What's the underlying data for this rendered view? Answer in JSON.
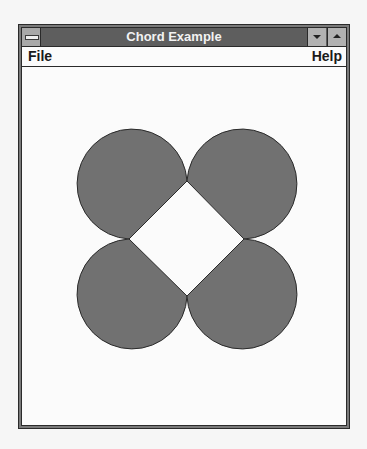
{
  "window": {
    "title": "Chord Example",
    "system_menu_icon": "system-menu-icon",
    "minimize_icon": "minimize-arrow-icon",
    "maximize_icon": "maximize-arrow-icon"
  },
  "menubar": {
    "items": [
      {
        "label": "File"
      },
      {
        "label": "Help"
      }
    ]
  },
  "canvas": {
    "fill_color": "#717171",
    "stroke_color": "#2a2a2a",
    "shapes": [
      {
        "name": "chord-top-left",
        "type": "chord"
      },
      {
        "name": "chord-top-right",
        "type": "chord"
      },
      {
        "name": "chord-bottom-left",
        "type": "chord"
      },
      {
        "name": "chord-bottom-right",
        "type": "chord"
      }
    ]
  }
}
